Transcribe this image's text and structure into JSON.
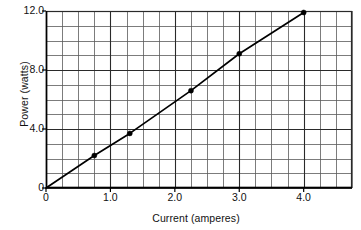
{
  "chart_data": {
    "type": "line",
    "title": "",
    "xlabel": "Current (amperes)",
    "ylabel": "Power (watts)",
    "xlim": [
      0,
      4.75
    ],
    "ylim": [
      0,
      12.0
    ],
    "grid": true,
    "legend": false,
    "x_major_ticks": [
      {
        "value": 0,
        "label": "0"
      },
      {
        "value": 1.0,
        "label": "1.0"
      },
      {
        "value": 2.0,
        "label": "2.0"
      },
      {
        "value": 3.0,
        "label": "3.0"
      },
      {
        "value": 4.0,
        "label": "4.0"
      }
    ],
    "y_major_ticks": [
      {
        "value": 0,
        "label": "0"
      },
      {
        "value": 4.0,
        "label": "4.0"
      },
      {
        "value": 8.0,
        "label": "8.0"
      },
      {
        "value": 12.0,
        "label": "12.0"
      }
    ],
    "x_grid_step": 0.25,
    "y_grid_step": 1.0,
    "series": [
      {
        "name": "Power vs Current",
        "line_color": "#000000",
        "marker": "circle",
        "marker_color": "#000000",
        "x": [
          0,
          0.75,
          1.3,
          2.25,
          3.0,
          4.0
        ],
        "y": [
          0,
          2.2,
          3.7,
          6.6,
          9.1,
          11.9
        ],
        "points": [
          {
            "x": 0.75,
            "y": 2.2
          },
          {
            "x": 1.3,
            "y": 3.7
          },
          {
            "x": 2.25,
            "y": 6.6
          },
          {
            "x": 3.0,
            "y": 9.1
          },
          {
            "x": 4.0,
            "y": 11.9
          }
        ]
      }
    ]
  }
}
